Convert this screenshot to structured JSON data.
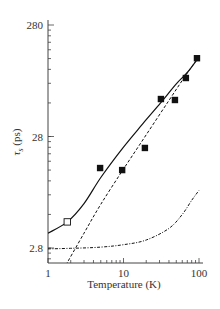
{
  "chart_data": {
    "type": "scatter",
    "title": "",
    "xlabel": "Temperature (K)",
    "ylabel": "τs (ps)",
    "ylabel_main": "τ",
    "ylabel_sub": "s",
    "ylabel_unit": " (ps)",
    "xscale": "log",
    "yscale": "log",
    "xlim": [
      1,
      100
    ],
    "ylim": [
      2.5,
      330
    ],
    "x_ticks": [
      1,
      10,
      100
    ],
    "x_tick_labels": [
      "1",
      "10",
      "100"
    ],
    "y_ticks": [
      2.8,
      28,
      280
    ],
    "y_tick_labels": [
      "2.8",
      "28",
      "280"
    ],
    "grid": false,
    "legend": null,
    "series": [
      {
        "name": "measured (filled squares)",
        "kind": "scatter",
        "marker": "filled-square",
        "x": [
          4.9,
          9.6,
          19.2,
          31.3,
          48,
          67,
          94
        ],
        "y": [
          14.6,
          14.0,
          22.1,
          60.7,
          59.5,
          93.7,
          141
        ]
      },
      {
        "name": "measured (open square)",
        "kind": "scatter",
        "marker": "open-square",
        "x": [
          1.8
        ],
        "y": [
          4.8
        ]
      },
      {
        "name": "total fit (solid)",
        "kind": "line",
        "style": "solid",
        "x": [
          1,
          1.8,
          3.0,
          5.0,
          10,
          19,
          31,
          50,
          70,
          100
        ],
        "y": [
          3.8,
          4.8,
          7.0,
          12.0,
          22.5,
          38,
          56,
          83,
          105,
          145
        ]
      },
      {
        "name": "power-law component (dashed)",
        "kind": "line",
        "style": "dashed",
        "x": [
          1.6,
          3,
          5,
          10,
          20,
          40,
          70,
          100
        ],
        "y": [
          1.8,
          3.8,
          6.9,
          14.3,
          29,
          59,
          104,
          145
        ]
      },
      {
        "name": "activated component (dash-dot)",
        "kind": "line",
        "style": "dash-dot",
        "x": [
          1,
          2,
          5,
          10,
          20,
          40,
          60,
          80,
          100
        ],
        "y": [
          2.75,
          2.78,
          2.85,
          3.0,
          3.3,
          4.2,
          5.6,
          7.5,
          9.2
        ]
      }
    ],
    "colors": {
      "axis": "#444444",
      "ink": "#111111",
      "text": "#333333"
    }
  }
}
